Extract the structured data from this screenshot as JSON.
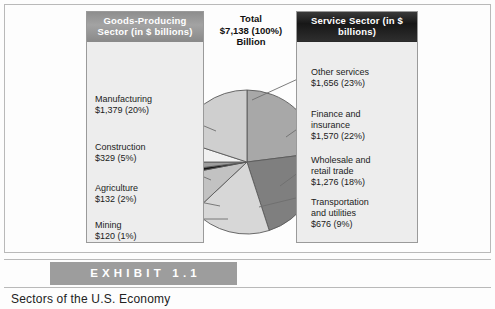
{
  "exhibit": {
    "label": "EXHIBIT 1.1",
    "caption": "Sectors of the U.S. Economy"
  },
  "total": {
    "line1": "Total",
    "line2": "$7,138 (100%)",
    "line3": "Billion"
  },
  "goods_panel": {
    "header_line1": "Goods-Producing Sector",
    "header_line2": "(in $ billions)",
    "items": [
      {
        "name": "Manufacturing",
        "value": "$1,379 (20%)"
      },
      {
        "name": "Construction",
        "value": "$329 (5%)"
      },
      {
        "name": "Agriculture",
        "value": "$132 (2%)"
      },
      {
        "name": "Mining",
        "value": "$120 (1%)"
      }
    ]
  },
  "service_panel": {
    "header_line1": "Service Sector",
    "header_line2": "(in $ billions)",
    "items": [
      {
        "name": "Other services",
        "value": "$1,656 (23%)"
      },
      {
        "name": "Finance and",
        "name2": "insurance",
        "value": "$1,570 (22%)"
      },
      {
        "name": "Wholesale and",
        "name2": "retail trade",
        "value": "$1,276 (18%)"
      },
      {
        "name": "Transportation",
        "name2": "and utilities",
        "value": "$676 (9%)"
      }
    ]
  },
  "chart_data": {
    "type": "pie",
    "title": "Sectors of the U.S. Economy",
    "total_label": "$7,138 (100%) Billion",
    "units": "$ billions",
    "legend_position": "outside-left-and-right",
    "categories": [
      "Other services",
      "Finance and insurance",
      "Wholesale and retail trade",
      "Transportation and utilities",
      "Mining",
      "Agriculture",
      "Construction",
      "Manufacturing"
    ],
    "values": [
      1656,
      1570,
      1276,
      676,
      120,
      132,
      329,
      1379
    ],
    "percentages": [
      23,
      22,
      18,
      9,
      1,
      2,
      5,
      20
    ],
    "colors": [
      "#a8a8a8",
      "#808080",
      "#d6d6d6",
      "#bdbdbd",
      "#141414",
      "#9a9a9a",
      "#efefef",
      "#cacaca"
    ],
    "total": 7138
  },
  "pie": {
    "center_x": 247,
    "center_y": 162,
    "radius": 72,
    "stroke": "#5a5a5a",
    "start_angle_deg": -90,
    "slices": [
      {
        "name": "other-services",
        "percent": 23,
        "color": "#a8a8a8"
      },
      {
        "name": "finance-and-insurance",
        "percent": 22,
        "color": "#7f7f7f"
      },
      {
        "name": "wholesale-and-retail-trade",
        "percent": 18,
        "color": "#d7d7d7"
      },
      {
        "name": "transportation-and-utilities",
        "percent": 9,
        "color": "#c2c2c2"
      },
      {
        "name": "mining",
        "percent": 1,
        "color": "#141414"
      },
      {
        "name": "agriculture",
        "percent": 2,
        "color": "#9d9d9d"
      },
      {
        "name": "construction",
        "percent": 5,
        "color": "#f1f1f1"
      },
      {
        "name": "manufacturing",
        "percent": 20,
        "color": "#cfcfcf"
      }
    ]
  }
}
